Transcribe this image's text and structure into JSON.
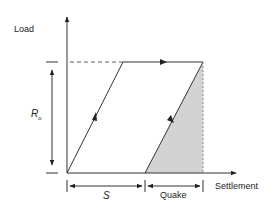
{
  "diagram": {
    "y_axis_label": "Load",
    "x_axis_label": "Settlement",
    "ultimate_resistance": {
      "symbol": "R",
      "subscript": "u"
    },
    "set_label": "S",
    "quake_label": "Quake",
    "colors": {
      "line": "#333333",
      "shade": "#d3d3d3"
    }
  }
}
